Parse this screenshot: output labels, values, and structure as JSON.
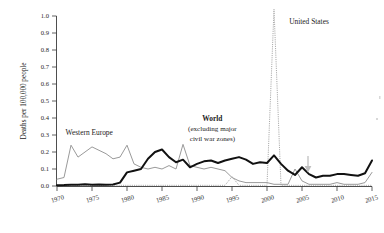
{
  "chart_data": {
    "type": "line",
    "title": "",
    "subtitle": "",
    "xlabel": "",
    "ylabel": "Deaths per 100,000 people",
    "xlim": [
      1970,
      2015
    ],
    "ylim": [
      0.0,
      1.0
    ],
    "grid": false,
    "legend_position": "inline-annotations",
    "x_ticks": [
      "1970",
      "1975",
      "1980",
      "1985",
      "1990",
      "1995",
      "2000",
      "2005",
      "2010",
      "2015"
    ],
    "x_tick_values": [
      1970,
      1975,
      1980,
      1985,
      1990,
      1995,
      2000,
      2005,
      2010,
      2015
    ],
    "y_ticks": [
      "0.0",
      "0.1",
      "0.2",
      "0.3",
      "0.4",
      "0.5",
      "0.6",
      "0.7",
      "0.8",
      "0.9",
      "1.0"
    ],
    "y_tick_values": [
      0.0,
      0.1,
      0.2,
      0.3,
      0.4,
      0.5,
      0.6,
      0.7,
      0.8,
      0.9,
      1.0
    ],
    "x": [
      1970,
      1971,
      1972,
      1973,
      1974,
      1975,
      1976,
      1977,
      1978,
      1979,
      1980,
      1981,
      1982,
      1983,
      1984,
      1985,
      1986,
      1987,
      1988,
      1989,
      1990,
      1991,
      1992,
      1993,
      1994,
      1995,
      1996,
      1997,
      1998,
      1999,
      2000,
      2001,
      2002,
      2003,
      2004,
      2005,
      2006,
      2007,
      2008,
      2009,
      2010,
      2011,
      2012,
      2013,
      2014,
      2015
    ],
    "series": [
      {
        "name": "Western Europe",
        "color": "#9a9a9a",
        "style": "thin-solid-gray",
        "values": [
          0.04,
          0.05,
          0.24,
          0.17,
          0.2,
          0.23,
          0.21,
          0.19,
          0.16,
          0.17,
          0.24,
          0.13,
          0.11,
          0.1,
          0.11,
          0.1,
          0.12,
          0.1,
          0.245,
          0.12,
          0.11,
          0.1,
          0.11,
          0.1,
          0.09,
          0.05,
          0.03,
          0.02,
          0.02,
          0.02,
          0.02,
          0.01,
          0.01,
          0.01,
          0.1,
          0.03,
          0.01,
          0.01,
          0.01,
          0.01,
          0.02,
          0.01,
          0.01,
          0.01,
          0.02,
          0.08
        ]
      },
      {
        "name": "World (excluding major civil war zones)",
        "color": "#111111",
        "style": "bold-solid-black",
        "values": [
          0.005,
          0.006,
          0.008,
          0.007,
          0.01,
          0.008,
          0.009,
          0.008,
          0.009,
          0.02,
          0.08,
          0.09,
          0.1,
          0.16,
          0.2,
          0.215,
          0.17,
          0.14,
          0.155,
          0.11,
          0.13,
          0.145,
          0.15,
          0.135,
          0.15,
          0.16,
          0.17,
          0.155,
          0.13,
          0.14,
          0.135,
          0.18,
          0.13,
          0.09,
          0.065,
          0.11,
          0.07,
          0.05,
          0.06,
          0.06,
          0.07,
          0.07,
          0.065,
          0.06,
          0.075,
          0.15
        ]
      },
      {
        "name": "United States",
        "color": "#a8a8a8",
        "style": "dotted-gray",
        "values": [
          0.004,
          0.004,
          0.004,
          0.004,
          0.004,
          0.004,
          0.004,
          0.004,
          0.004,
          0.004,
          0.004,
          0.004,
          0.004,
          0.004,
          0.004,
          0.004,
          0.004,
          0.004,
          0.004,
          0.004,
          0.004,
          0.004,
          0.004,
          0.004,
          0.004,
          0.055,
          0.004,
          0.004,
          0.004,
          0.004,
          0.004,
          1.04,
          0.004,
          0.004,
          0.004,
          0.004,
          0.004,
          0.004,
          0.004,
          0.004,
          0.004,
          0.004,
          0.004,
          0.004,
          0.004,
          0.004
        ]
      }
    ],
    "annotations": [
      {
        "name": "western-europe",
        "text": "Western Europe",
        "x": 1974.6,
        "y": 0.3
      },
      {
        "name": "united-states",
        "text": "United States",
        "x": 2006.0,
        "y": 0.955
      },
      {
        "name": "world-line1",
        "text": "World",
        "x": 1992.2,
        "y": 0.385
      },
      {
        "name": "world-line2",
        "text": "(excluding major",
        "x": 1992.2,
        "y": 0.325
      },
      {
        "name": "world-line3",
        "text": "civil war zones)",
        "x": 1992.2,
        "y": 0.265
      },
      {
        "name": "down-arrow-marker",
        "text": "",
        "x": 2007.2,
        "y": 0.18
      }
    ]
  }
}
